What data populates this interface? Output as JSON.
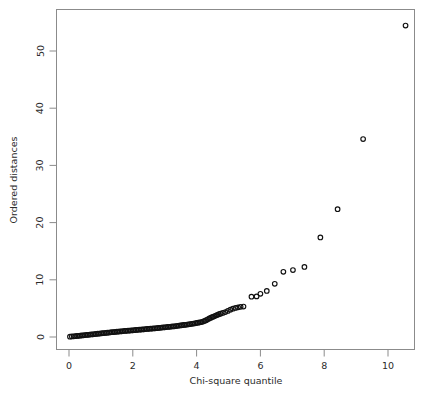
{
  "chart_data": {
    "type": "scatter",
    "title": "",
    "subtitle": "",
    "xlabel": "Chi-square quantile",
    "ylabel": "Ordered distances",
    "xlim": [
      -0.3,
      10.9
    ],
    "ylim": [
      -1.8,
      56.5
    ],
    "xticks": [
      0,
      2,
      4,
      6,
      8,
      10
    ],
    "yticks": [
      0,
      10,
      20,
      30,
      40,
      50
    ],
    "xtick_labels": [
      "0",
      "2",
      "4",
      "6",
      "8",
      "10"
    ],
    "ytick_labels": [
      "0",
      "10",
      "20",
      "30",
      "40",
      "50"
    ],
    "grid": false,
    "legend": null,
    "marker": "open-circle",
    "marker_color": "#111111",
    "frame_color": "#8b8b8b",
    "background": "#ffffff",
    "annotations": [],
    "series": [
      {
        "name": "Ordered distances vs Chi-square quantile",
        "points": [
          [
            0.03,
            0.05
          ],
          [
            0.09,
            0.09
          ],
          [
            0.15,
            0.12
          ],
          [
            0.2,
            0.15
          ],
          [
            0.25,
            0.18
          ],
          [
            0.3,
            0.21
          ],
          [
            0.35,
            0.24
          ],
          [
            0.4,
            0.27
          ],
          [
            0.45,
            0.3
          ],
          [
            0.5,
            0.33
          ],
          [
            0.55,
            0.36
          ],
          [
            0.6,
            0.39
          ],
          [
            0.65,
            0.42
          ],
          [
            0.7,
            0.45
          ],
          [
            0.75,
            0.48
          ],
          [
            0.8,
            0.51
          ],
          [
            0.85,
            0.54
          ],
          [
            0.9,
            0.57
          ],
          [
            0.95,
            0.6
          ],
          [
            1.0,
            0.63
          ],
          [
            1.05,
            0.66
          ],
          [
            1.1,
            0.69
          ],
          [
            1.15,
            0.72
          ],
          [
            1.2,
            0.75
          ],
          [
            1.25,
            0.78
          ],
          [
            1.3,
            0.81
          ],
          [
            1.35,
            0.84
          ],
          [
            1.4,
            0.86
          ],
          [
            1.45,
            0.89
          ],
          [
            1.5,
            0.92
          ],
          [
            1.55,
            0.95
          ],
          [
            1.6,
            0.97
          ],
          [
            1.65,
            1.0
          ],
          [
            1.7,
            1.03
          ],
          [
            1.75,
            1.05
          ],
          [
            1.8,
            1.08
          ],
          [
            1.85,
            1.1
          ],
          [
            1.9,
            1.13
          ],
          [
            1.95,
            1.15
          ],
          [
            2.0,
            1.18
          ],
          [
            2.05,
            1.2
          ],
          [
            2.1,
            1.23
          ],
          [
            2.15,
            1.25
          ],
          [
            2.2,
            1.28
          ],
          [
            2.25,
            1.3
          ],
          [
            2.3,
            1.33
          ],
          [
            2.35,
            1.35
          ],
          [
            2.4,
            1.38
          ],
          [
            2.45,
            1.4
          ],
          [
            2.5,
            1.43
          ],
          [
            2.55,
            1.45
          ],
          [
            2.6,
            1.48
          ],
          [
            2.65,
            1.5
          ],
          [
            2.7,
            1.53
          ],
          [
            2.75,
            1.55
          ],
          [
            2.8,
            1.58
          ],
          [
            2.85,
            1.61
          ],
          [
            2.9,
            1.64
          ],
          [
            2.95,
            1.67
          ],
          [
            3.0,
            1.7
          ],
          [
            3.05,
            1.73
          ],
          [
            3.1,
            1.76
          ],
          [
            3.15,
            1.79
          ],
          [
            3.2,
            1.82
          ],
          [
            3.25,
            1.85
          ],
          [
            3.3,
            1.88
          ],
          [
            3.35,
            1.92
          ],
          [
            3.4,
            1.95
          ],
          [
            3.45,
            1.99
          ],
          [
            3.5,
            2.02
          ],
          [
            3.55,
            2.06
          ],
          [
            3.6,
            2.1
          ],
          [
            3.65,
            2.14
          ],
          [
            3.7,
            2.18
          ],
          [
            3.75,
            2.22
          ],
          [
            3.8,
            2.26
          ],
          [
            3.85,
            2.31
          ],
          [
            3.9,
            2.35
          ],
          [
            3.95,
            2.4
          ],
          [
            4.0,
            2.45
          ],
          [
            4.05,
            2.5
          ],
          [
            4.1,
            2.56
          ],
          [
            4.15,
            2.62
          ],
          [
            4.2,
            2.7
          ],
          [
            4.25,
            2.8
          ],
          [
            4.3,
            2.95
          ],
          [
            4.35,
            3.1
          ],
          [
            4.4,
            3.25
          ],
          [
            4.45,
            3.38
          ],
          [
            4.5,
            3.5
          ],
          [
            4.55,
            3.62
          ],
          [
            4.6,
            3.74
          ],
          [
            4.65,
            3.86
          ],
          [
            4.7,
            3.98
          ],
          [
            4.75,
            4.08
          ],
          [
            4.82,
            4.2
          ],
          [
            4.9,
            4.35
          ],
          [
            4.98,
            4.55
          ],
          [
            5.06,
            4.78
          ],
          [
            5.14,
            4.95
          ],
          [
            5.22,
            5.08
          ],
          [
            5.3,
            5.18
          ],
          [
            5.38,
            5.28
          ],
          [
            5.47,
            5.32
          ],
          [
            5.72,
            7.05
          ],
          [
            5.88,
            7.1
          ],
          [
            6.0,
            7.55
          ],
          [
            6.2,
            8.05
          ],
          [
            6.45,
            9.3
          ],
          [
            6.72,
            11.4
          ],
          [
            7.02,
            11.7
          ],
          [
            7.38,
            12.25
          ],
          [
            7.88,
            17.4
          ],
          [
            8.42,
            22.35
          ],
          [
            9.22,
            34.6
          ],
          [
            10.55,
            54.45
          ]
        ]
      }
    ]
  },
  "axis": {
    "x_title": "Chi-square quantile",
    "y_title": "Ordered distances"
  }
}
